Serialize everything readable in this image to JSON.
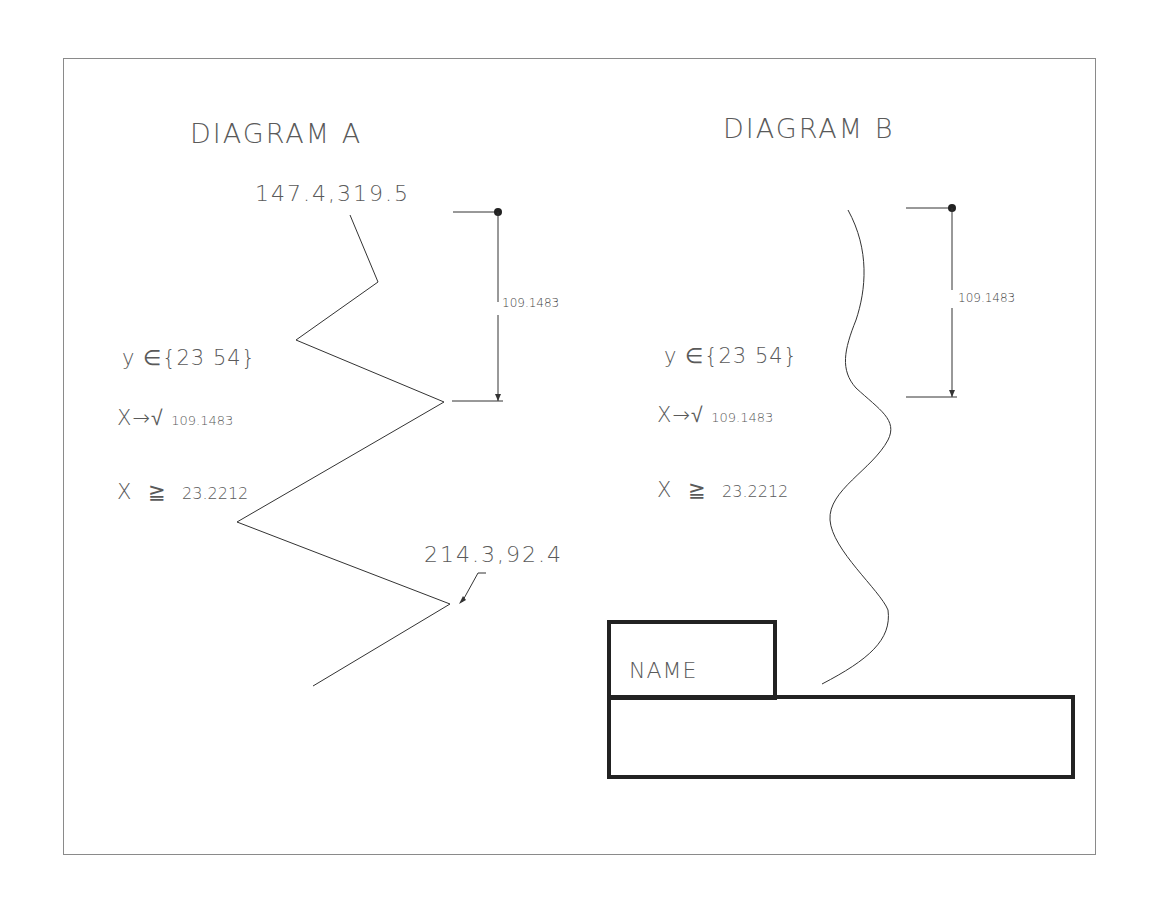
{
  "diagram_a": {
    "title": "DIAGRAM A",
    "top_coord": "147.4,319.5",
    "bottom_coord": "214.3,92.4",
    "dimension": "109.1483",
    "set_expr": {
      "var": "y",
      "op": "∈",
      "set": "{23 54}"
    },
    "sqrt_expr": {
      "var": "X",
      "arrow": "→",
      "root": "√",
      "value": "109.1483"
    },
    "ineq_expr": {
      "var": "X",
      "op": "≧",
      "value": "23.2212"
    },
    "polyline_points": [
      [
        350,
        215
      ],
      [
        378,
        282
      ],
      [
        296,
        340
      ],
      [
        444,
        402
      ],
      [
        237,
        522
      ],
      [
        450,
        604
      ],
      [
        313,
        686
      ]
    ]
  },
  "diagram_b": {
    "title": "DIAGRAM B",
    "dimension": "109.1483",
    "set_expr": {
      "var": "y",
      "op": "∈",
      "set": "{23 54}"
    },
    "sqrt_expr": {
      "var": "X",
      "arrow": "→",
      "root": "√",
      "value": "109.1483"
    },
    "ineq_expr": {
      "var": "X",
      "op": "≧",
      "value": "23.2212"
    }
  },
  "title_block": {
    "name_label": "NAME",
    "value": ""
  },
  "colors": {
    "line": "#333333",
    "text": "#5a5a5a",
    "frame": "#8a8a8a",
    "box_border": "#222222"
  }
}
